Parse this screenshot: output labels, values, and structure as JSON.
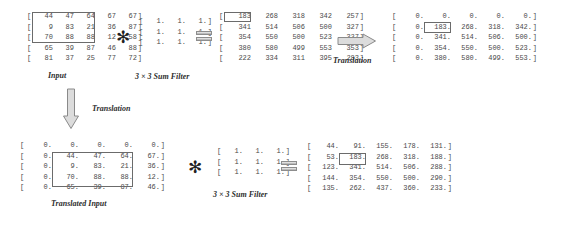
{
  "figure": {
    "captions": {
      "input": "Input",
      "filter_top": "3 × 3 Sum Filter",
      "filter_bottom": "3 × 3 Sum Filter",
      "translation_right": "Translation",
      "translation_down": "Translation",
      "translated_input": "Translated Input"
    },
    "operators": {
      "convolution": "✻",
      "equals": "equals-sign"
    },
    "icons": {
      "arrow_right": "arrow-right-icon",
      "arrow_down": "arrow-down-icon"
    }
  },
  "matrices": {
    "input": {
      "name": "input-matrix",
      "rows": [
        [
          "44",
          "47",
          "64",
          "67",
          "67"
        ],
        [
          "9",
          "83",
          "21",
          "36",
          "87"
        ],
        [
          "70",
          "88",
          "88",
          "12",
          "58"
        ],
        [
          "65",
          "39",
          "87",
          "46",
          "88"
        ],
        [
          "81",
          "37",
          "25",
          "77",
          "72"
        ]
      ],
      "highlight": {
        "rows": [
          0,
          2
        ],
        "cols": [
          0,
          2
        ]
      }
    },
    "sum_filter_top": {
      "name": "sum-filter-matrix-top",
      "rows": [
        [
          "1.",
          "1.",
          "1."
        ],
        [
          "1.",
          "1.",
          "1."
        ],
        [
          "1.",
          "1.",
          "1."
        ]
      ]
    },
    "sum_filter_bottom": {
      "name": "sum-filter-matrix-bottom",
      "rows": [
        [
          "1.",
          "1.",
          "1."
        ],
        [
          "1.",
          "1.",
          "1."
        ],
        [
          "1.",
          "1.",
          "1."
        ]
      ]
    },
    "conv_result": {
      "name": "convolution-result-matrix",
      "rows": [
        [
          "183",
          "268",
          "318",
          "342",
          "257"
        ],
        [
          "341",
          "514",
          "506",
          "500",
          "327"
        ],
        [
          "354",
          "550",
          "500",
          "523",
          "327"
        ],
        [
          "380",
          "580",
          "499",
          "553",
          "353"
        ],
        [
          "222",
          "334",
          "311",
          "395",
          "283"
        ]
      ],
      "highlight": {
        "rows": [
          0,
          0
        ],
        "cols": [
          0,
          0
        ]
      }
    },
    "translated_result": {
      "name": "translated-result-matrix",
      "rows": [
        [
          "0.",
          "0.",
          "0.",
          "0.",
          "0."
        ],
        [
          "0.",
          "183.",
          "268.",
          "318.",
          "342."
        ],
        [
          "0.",
          "341.",
          "514.",
          "506.",
          "500."
        ],
        [
          "0.",
          "354.",
          "550.",
          "500.",
          "523."
        ],
        [
          "0.",
          "380.",
          "580.",
          "499.",
          "553."
        ]
      ],
      "highlight": {
        "rows": [
          1,
          1
        ],
        "cols": [
          1,
          1
        ]
      }
    },
    "translated_input": {
      "name": "translated-input-matrix",
      "rows": [
        [
          "0.",
          "0.",
          "0.",
          "0.",
          "0."
        ],
        [
          "0.",
          "44.",
          "47.",
          "64.",
          "67."
        ],
        [
          "0.",
          "9.",
          "83.",
          "21.",
          "36."
        ],
        [
          "0.",
          "70.",
          "88.",
          "88.",
          "12."
        ],
        [
          "0.",
          "65.",
          "39.",
          "87.",
          "46."
        ]
      ],
      "highlight": {
        "rows": [
          1,
          3
        ],
        "cols": [
          1,
          3
        ]
      }
    },
    "bottom_result": {
      "name": "bottom-result-matrix",
      "rows": [
        [
          "44.",
          "91.",
          "155.",
          "178.",
          "131."
        ],
        [
          "53.",
          "183.",
          "268.",
          "318.",
          "188."
        ],
        [
          "123.",
          "341.",
          "514.",
          "506.",
          "288."
        ],
        [
          "144.",
          "354.",
          "550.",
          "500.",
          "290."
        ],
        [
          "135.",
          "262.",
          "437.",
          "360.",
          "233."
        ]
      ],
      "highlight": {
        "rows": [
          1,
          1
        ],
        "cols": [
          1,
          1
        ]
      }
    }
  },
  "colors": {
    "text": "#4a4a4a",
    "caption": "#2e2e2e",
    "highlight_border": "#6b6b6b",
    "arrow_fill": "#d8d8d8",
    "arrow_stroke": "#8a8a8a"
  }
}
